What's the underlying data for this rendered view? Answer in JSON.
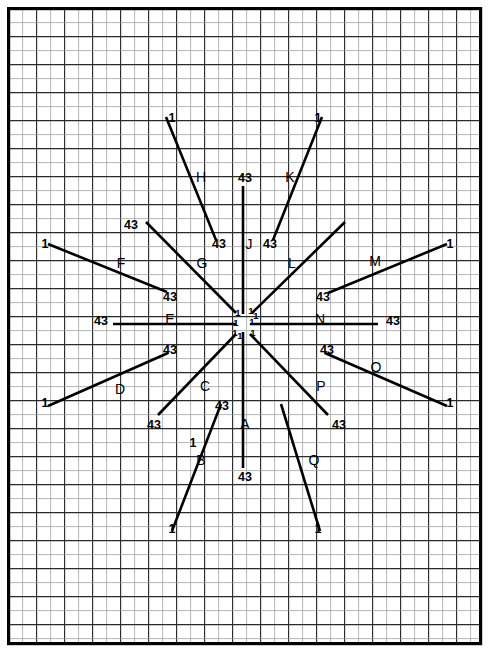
{
  "figure": {
    "kind": "starburst-ray-diagram",
    "background_color": "#ffffff",
    "line_color": "#000000",
    "grid_minor_color": "#9a9a9a",
    "grid_major_color": "#2b2b2b",
    "frame_color": "#000000",
    "grid": {
      "cell_px": 14,
      "major_every": 1,
      "origin_x": 8,
      "origin_y": 8
    },
    "plot_frame": {
      "x": 7,
      "y": 7,
      "width": 475,
      "height": 638
    },
    "center": {
      "x": 243,
      "y": 322
    },
    "start_value_label": "1",
    "end_value_label": "43"
  },
  "chart_data": {
    "type": "line",
    "xlabel": "",
    "ylabel": "",
    "grid": true,
    "legend": "none",
    "center": {
      "x": 243,
      "y": 322
    },
    "series_value_range": [
      1,
      43
    ],
    "series": [
      {
        "name": "A",
        "label": "A",
        "label_pos": {
          "x": 245,
          "y": 425
        },
        "start_label": "43",
        "end_label": "",
        "x1": 243,
        "y1": 332,
        "x2": 243,
        "y2": 468,
        "start_label_pos": {
          "x": 245,
          "y": 478
        },
        "end_label_pos": null
      },
      {
        "name": "B",
        "label": "B",
        "label_pos": {
          "x": 201,
          "y": 461
        },
        "start_label": "1",
        "end_label": "43",
        "x1": 172,
        "y1": 531,
        "x2": 221,
        "y2": 404,
        "start_label_pos": {
          "x": 172,
          "y": 530
        },
        "end_label_pos": {
          "x": 222,
          "y": 407
        },
        "mid_label": "1",
        "mid_label_pos": {
          "x": 193,
          "y": 444
        }
      },
      {
        "name": "C",
        "label": "C",
        "label_pos": {
          "x": 205,
          "y": 387
        },
        "start_label": "43",
        "end_label": "",
        "x1": 158,
        "y1": 415,
        "x2": 236,
        "y2": 334,
        "start_label_pos": {
          "x": 154,
          "y": 426
        },
        "end_label_pos": null
      },
      {
        "name": "D",
        "label": "D",
        "label_pos": {
          "x": 120,
          "y": 390
        },
        "start_label": "1",
        "end_label": "43",
        "x1": 48,
        "y1": 406,
        "x2": 168,
        "y2": 353,
        "start_label_pos": {
          "x": 45,
          "y": 404
        },
        "end_label_pos": {
          "x": 170,
          "y": 351
        }
      },
      {
        "name": "E",
        "label": "E",
        "label_pos": {
          "x": 170,
          "y": 320
        },
        "start_label": "43",
        "end_label": "",
        "x1": 113,
        "y1": 324,
        "x2": 236,
        "y2": 324,
        "start_label_pos": {
          "x": 101,
          "y": 322
        },
        "end_label_pos": null
      },
      {
        "name": "F",
        "label": "F",
        "label_pos": {
          "x": 121,
          "y": 264
        },
        "start_label": "1",
        "end_label": "43",
        "x1": 48,
        "y1": 244,
        "x2": 167,
        "y2": 292,
        "start_label_pos": {
          "x": 45,
          "y": 245
        },
        "end_label_pos": {
          "x": 170,
          "y": 298
        }
      },
      {
        "name": "G",
        "label": "G",
        "label_pos": {
          "x": 202,
          "y": 264
        },
        "start_label": "43",
        "end_label": "",
        "x1": 146,
        "y1": 222,
        "x2": 236,
        "y2": 313,
        "start_label_pos": {
          "x": 131,
          "y": 226
        },
        "end_label_pos": null
      },
      {
        "name": "H",
        "label": "H",
        "label_pos": {
          "x": 201,
          "y": 178
        },
        "start_label": "1",
        "end_label": "43",
        "x1": 166,
        "y1": 117,
        "x2": 216,
        "y2": 240,
        "start_label_pos": {
          "x": 172,
          "y": 119
        },
        "end_label_pos": {
          "x": 219,
          "y": 245
        }
      },
      {
        "name": "J",
        "label": "J",
        "label_pos": {
          "x": 249,
          "y": 245
        },
        "start_label": "43",
        "end_label": "",
        "x1": 243,
        "y1": 186,
        "x2": 243,
        "y2": 314,
        "start_label_pos": {
          "x": 245,
          "y": 179
        },
        "end_label_pos": null
      },
      {
        "name": "K",
        "label": "K",
        "label_pos": {
          "x": 290,
          "y": 178
        },
        "start_label": "1",
        "end_label": "43",
        "x1": 322,
        "y1": 117,
        "x2": 273,
        "y2": 240,
        "start_label_pos": {
          "x": 318,
          "y": 119
        },
        "end_label_pos": {
          "x": 270,
          "y": 245
        }
      },
      {
        "name": "L",
        "label": "L",
        "label_pos": {
          "x": 292,
          "y": 264
        },
        "start_label": "",
        "end_label": "",
        "x1": 345,
        "y1": 222,
        "x2": 252,
        "y2": 313,
        "start_label_pos": null,
        "end_label_pos": null
      },
      {
        "name": "M",
        "label": "M",
        "label_pos": {
          "x": 375,
          "y": 262
        },
        "start_label": "1",
        "end_label": "43",
        "x1": 447,
        "y1": 244,
        "x2": 328,
        "y2": 293,
        "start_label_pos": {
          "x": 450,
          "y": 245
        },
        "end_label_pos": {
          "x": 323,
          "y": 298
        }
      },
      {
        "name": "N",
        "label": "N",
        "label_pos": {
          "x": 320,
          "y": 320
        },
        "start_label": "43",
        "end_label": "",
        "x1": 250,
        "y1": 324,
        "x2": 378,
        "y2": 324,
        "start_label_pos": {
          "x": 393,
          "y": 322
        },
        "end_label_pos": null
      },
      {
        "name": "O",
        "label": "O",
        "label_pos": {
          "x": 376,
          "y": 368
        },
        "start_label": "43",
        "end_label": "1",
        "x1": 325,
        "y1": 353,
        "x2": 447,
        "y2": 406,
        "start_label_pos": {
          "x": 327,
          "y": 351
        },
        "end_label_pos": {
          "x": 450,
          "y": 404
        }
      },
      {
        "name": "P",
        "label": "P",
        "label_pos": {
          "x": 321,
          "y": 387
        },
        "start_label": "43",
        "end_label": "",
        "x1": 250,
        "y1": 334,
        "x2": 328,
        "y2": 415,
        "start_label_pos": {
          "x": 339,
          "y": 426
        },
        "end_label_pos": null
      },
      {
        "name": "Q",
        "label": "Q",
        "label_pos": {
          "x": 314,
          "y": 461
        },
        "start_label": "1",
        "end_label": "",
        "x1": 281,
        "y1": 404,
        "x2": 320,
        "y2": 531,
        "start_label_pos": {
          "x": 318,
          "y": 530
        },
        "end_label_pos": null
      }
    ],
    "center_tick_labels": [
      {
        "text": "1",
        "x": 238,
        "y": 313
      },
      {
        "text": "1",
        "x": 251,
        "y": 311
      },
      {
        "text": "1",
        "x": 256,
        "y": 316
      },
      {
        "text": "1",
        "x": 236,
        "y": 323
      },
      {
        "text": "1",
        "x": 252,
        "y": 322
      },
      {
        "text": "1",
        "x": 235,
        "y": 333
      },
      {
        "text": "1",
        "x": 240,
        "y": 336
      },
      {
        "text": "1",
        "x": 253,
        "y": 333
      }
    ]
  }
}
